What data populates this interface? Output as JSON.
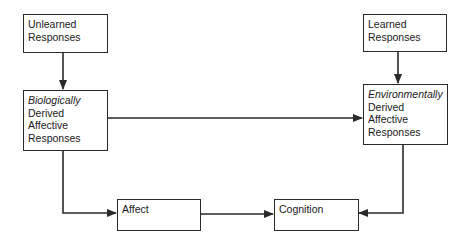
{
  "diagram": {
    "nodes": {
      "unlearned": {
        "lines": [
          "Unlearned",
          "Responses"
        ]
      },
      "learned": {
        "lines": [
          "Learned",
          "Responses"
        ]
      },
      "biological": {
        "italic": "Biologically",
        "lines": [
          "Derived",
          "Affective",
          "Responses"
        ]
      },
      "environmental": {
        "italic": "Environmentally",
        "lines": [
          "Derived",
          "Affective",
          "Responses"
        ]
      },
      "affect": {
        "label": "Affect"
      },
      "cognition": {
        "label": "Cognition"
      }
    },
    "edges": [
      {
        "from": "Unlearned Responses",
        "to": "Biologically Derived Affective Responses",
        "type": "arrow"
      },
      {
        "from": "Learned Responses",
        "to": "Environmentally Derived Affective Responses",
        "type": "arrow"
      },
      {
        "from": "Biologically Derived Affective Responses",
        "to": "Environmentally Derived Affective Responses",
        "type": "bidirectional"
      },
      {
        "from": "Biologically Derived Affective Responses",
        "to": "Affect",
        "type": "arrow"
      },
      {
        "from": "Environmentally Derived Affective Responses",
        "to": "Cognition",
        "type": "arrow"
      },
      {
        "from": "Affect",
        "to": "Cognition",
        "type": "bidirectional"
      }
    ],
    "colors": {
      "line": "#2a2a2a",
      "background": "#ffffff"
    }
  }
}
